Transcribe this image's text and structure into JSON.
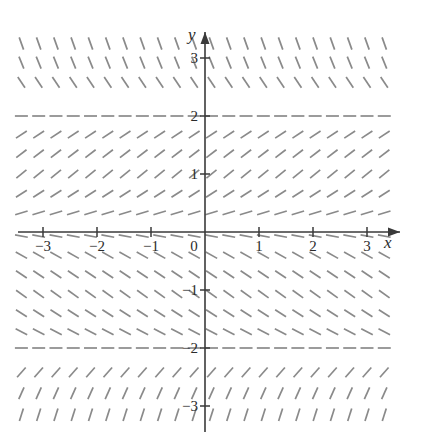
{
  "figure": {
    "kind": "slope-field",
    "background_color": "#ffffff",
    "axis_color": "#3a3a3a",
    "segment_color": "#8a8a8a",
    "label_color": "#2b2b2b"
  },
  "chart_data": {
    "type": "scatter",
    "title": "",
    "subtitle": "",
    "xlabel": "x",
    "ylabel": "y",
    "xlim": [
      -3.55,
      3.55
    ],
    "ylim": [
      -3.45,
      3.45
    ],
    "grid": false,
    "legend": null,
    "annotations": [],
    "x_tick_labels": [
      "−3",
      "−2",
      "−1",
      "0",
      "1",
      "2",
      "3"
    ],
    "x_tick_values": [
      -3,
      -2,
      -1,
      0,
      1,
      2,
      3
    ],
    "y_tick_labels": [
      "−3",
      "−2",
      "−1",
      "2",
      "1",
      "3"
    ],
    "y_tick_values": [
      -3,
      -2,
      -1,
      1,
      2,
      3
    ],
    "origin_label": "0",
    "field_description": "Direction field of an autonomous first order ODE; slope depends only on y. Equilibrium (horizontal) rows at y = 2 and y = -2.",
    "equilibria": [
      2,
      -2
    ],
    "slope_rows": [
      {
        "y": 3.25,
        "slope": -2.6
      },
      {
        "y": 2.92,
        "slope": -2.3
      },
      {
        "y": 2.58,
        "slope": -1.4
      },
      {
        "y": 2.0,
        "slope": 0.0
      },
      {
        "y": 1.68,
        "slope": 0.62
      },
      {
        "y": 1.35,
        "slope": 0.72
      },
      {
        "y": 1.0,
        "slope": 0.75
      },
      {
        "y": 0.66,
        "slope": 0.6
      },
      {
        "y": 0.33,
        "slope": 0.28
      },
      {
        "y": -0.07,
        "slope": -0.17
      },
      {
        "y": -0.4,
        "slope": -0.52
      },
      {
        "y": -0.73,
        "slope": -0.62
      },
      {
        "y": -1.07,
        "slope": -0.66
      },
      {
        "y": -1.4,
        "slope": -0.6
      },
      {
        "y": -1.72,
        "slope": -0.48
      },
      {
        "y": -2.0,
        "slope": 0.0
      },
      {
        "y": -2.42,
        "slope": 1.05
      },
      {
        "y": -2.78,
        "slope": 2.1
      },
      {
        "y": -3.15,
        "slope": 2.9
      }
    ],
    "column_x_values": [
      -3.4,
      -3.08,
      -2.76,
      -2.44,
      -2.12,
      -1.8,
      -1.48,
      -1.16,
      -0.84,
      -0.52,
      -0.2,
      0.12,
      0.44,
      0.76,
      1.08,
      1.4,
      1.72,
      2.04,
      2.36,
      2.68,
      3.0,
      3.32
    ],
    "segment_pixel_length": 13
  }
}
